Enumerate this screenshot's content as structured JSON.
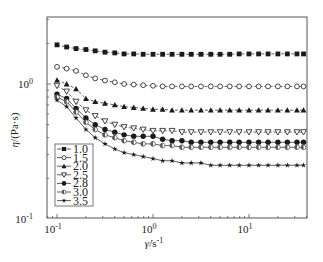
{
  "chart_data": {
    "type": "line",
    "title": "",
    "xlabel": "γ̇/s⁻¹",
    "ylabel": "η/(Pa·s)",
    "xscale": "log",
    "yscale": "log",
    "xlim": [
      0.079,
      40
    ],
    "ylim": [
      0.1,
      3.2
    ],
    "x_ticks": [
      {
        "value": 0.1,
        "label": "10",
        "exp": "-1"
      },
      {
        "value": 1,
        "label": "10",
        "exp": "0"
      },
      {
        "value": 10,
        "label": "10",
        "exp": "1"
      }
    ],
    "y_ticks": [
      {
        "value": 0.1,
        "label": "10",
        "exp": "-1"
      },
      {
        "value": 1,
        "label": "10",
        "exp": "0"
      }
    ],
    "grid": false,
    "legend_position": "lower left",
    "x": [
      0.1,
      0.126,
      0.158,
      0.2,
      0.25,
      0.316,
      0.4,
      0.5,
      0.63,
      0.79,
      1.0,
      1.26,
      1.58,
      2.0,
      2.5,
      3.16,
      4.0,
      5.0,
      6.3,
      7.9,
      10.0,
      12.6,
      15.8,
      20.0,
      25.1,
      31.6,
      37.0
    ],
    "series": [
      {
        "name": "1.0",
        "marker": "square-filled",
        "values": [
          1.95,
          1.88,
          1.83,
          1.8,
          1.76,
          1.72,
          1.7,
          1.67,
          1.67,
          1.66,
          1.66,
          1.66,
          1.66,
          1.66,
          1.66,
          1.66,
          1.66,
          1.66,
          1.66,
          1.67,
          1.67,
          1.67,
          1.67,
          1.67,
          1.67,
          1.67,
          1.67
        ]
      },
      {
        "name": "1.5",
        "marker": "circle-open",
        "values": [
          1.34,
          1.3,
          1.25,
          1.16,
          1.1,
          1.06,
          1.03,
          1.0,
          0.99,
          0.98,
          0.97,
          0.96,
          0.96,
          0.96,
          0.96,
          0.96,
          0.96,
          0.96,
          0.96,
          0.96,
          0.96,
          0.96,
          0.96,
          0.96,
          0.96,
          0.96,
          0.96
        ]
      },
      {
        "name": "2.0",
        "marker": "triangle-up-filled",
        "values": [
          1.07,
          1.0,
          0.92,
          0.78,
          0.74,
          0.72,
          0.7,
          0.68,
          0.67,
          0.66,
          0.65,
          0.65,
          0.64,
          0.64,
          0.64,
          0.64,
          0.64,
          0.64,
          0.64,
          0.64,
          0.64,
          0.64,
          0.64,
          0.64,
          0.64,
          0.64,
          0.64
        ]
      },
      {
        "name": "2.5",
        "marker": "triangle-down-open",
        "values": [
          0.97,
          0.88,
          0.74,
          0.64,
          0.58,
          0.53,
          0.5,
          0.48,
          0.47,
          0.46,
          0.45,
          0.45,
          0.45,
          0.44,
          0.44,
          0.44,
          0.44,
          0.44,
          0.44,
          0.44,
          0.44,
          0.44,
          0.44,
          0.44,
          0.44,
          0.44,
          0.44
        ]
      },
      {
        "name": "2.8",
        "marker": "diamond-filled",
        "values": [
          0.84,
          0.78,
          0.66,
          0.56,
          0.5,
          0.46,
          0.44,
          0.42,
          0.41,
          0.41,
          0.41,
          0.39,
          0.38,
          0.38,
          0.37,
          0.37,
          0.37,
          0.37,
          0.37,
          0.37,
          0.37,
          0.37,
          0.37,
          0.37,
          0.37,
          0.37,
          0.37
        ]
      },
      {
        "name": "3.0",
        "marker": "circle-half",
        "values": [
          0.8,
          0.74,
          0.62,
          0.52,
          0.46,
          0.42,
          0.4,
          0.38,
          0.37,
          0.36,
          0.36,
          0.35,
          0.35,
          0.34,
          0.34,
          0.34,
          0.34,
          0.34,
          0.34,
          0.34,
          0.34,
          0.34,
          0.34,
          0.34,
          0.34,
          0.34,
          0.34
        ]
      },
      {
        "name": "3.5",
        "marker": "star-filled",
        "values": [
          0.76,
          0.68,
          0.56,
          0.46,
          0.4,
          0.36,
          0.33,
          0.31,
          0.3,
          0.29,
          0.28,
          0.27,
          0.27,
          0.26,
          0.26,
          0.26,
          0.25,
          0.25,
          0.25,
          0.25,
          0.25,
          0.25,
          0.25,
          0.25,
          0.25,
          0.25,
          0.25
        ]
      }
    ]
  },
  "axes": {
    "xlabel_symbol": "γ̇",
    "xlabel_unit": "/s",
    "xlabel_exp": "-1",
    "ylabel_symbol": "η",
    "ylabel_unit": "/(Pa·s)"
  },
  "legend": {
    "entries": [
      "1.0",
      "1.5",
      "2.0",
      "2.5",
      "2.8",
      "3.0",
      "3.5"
    ]
  },
  "colors": {
    "ink": "#1a1a1a",
    "frame": "#555555",
    "background": "#ffffff"
  }
}
